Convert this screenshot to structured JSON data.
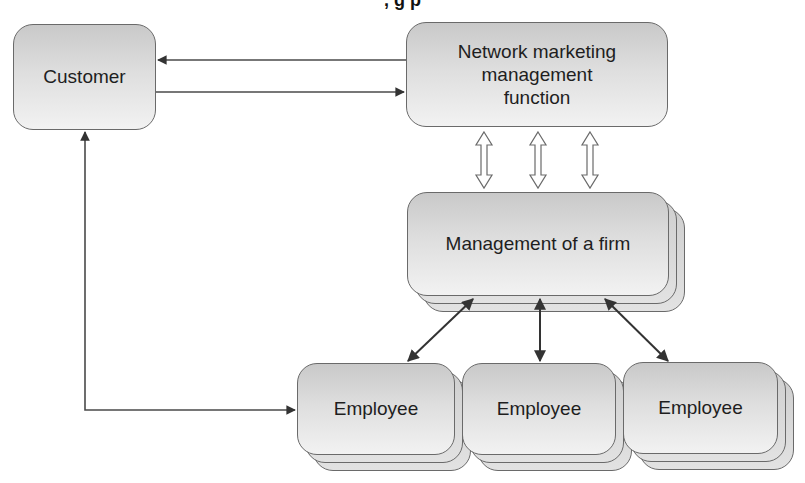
{
  "diagram": {
    "title_partial": ", g p",
    "nodes": {
      "customer": {
        "label": "Customer"
      },
      "network": {
        "label": "Network marketing\nmanagement\nfunction"
      },
      "management": {
        "label": "Management of a firm"
      },
      "employees": [
        {
          "label": "Employee"
        },
        {
          "label": "Employee"
        },
        {
          "label": "Employee"
        }
      ]
    },
    "edges": [
      {
        "from": "network",
        "to": "customer",
        "type": "arrow"
      },
      {
        "from": "customer",
        "to": "network",
        "type": "arrow"
      },
      {
        "from": "network",
        "to": "management",
        "type": "hollow-double-arrow",
        "count": 3
      },
      {
        "from": "management",
        "to": "employee-1",
        "type": "double-arrow"
      },
      {
        "from": "management",
        "to": "employee-2",
        "type": "double-arrow"
      },
      {
        "from": "management",
        "to": "employee-3",
        "type": "double-arrow"
      },
      {
        "from": "customer",
        "to": "employee-1",
        "type": "double-arrow-elbow"
      }
    ],
    "colors": {
      "stroke": "#3a3a3a",
      "box_border": "#6a6a6a",
      "box_fill_top": "#c9c9c9",
      "box_fill_bottom": "#f2f2f2"
    }
  }
}
